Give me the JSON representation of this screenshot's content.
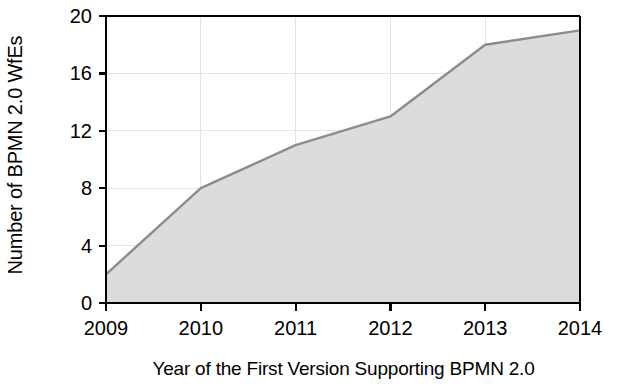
{
  "chart_data": {
    "type": "area",
    "title": "",
    "xlabel": "Year of the First Version Supporting BPMN 2.0",
    "ylabel": "Number of BPMN 2.0 WfEs",
    "categories": [
      "2009",
      "2010",
      "2011",
      "2012",
      "2013",
      "2014"
    ],
    "x": [
      2009,
      2010,
      2011,
      2012,
      2013,
      2014
    ],
    "values": [
      2,
      8,
      11,
      13,
      18,
      19
    ],
    "series": [
      {
        "name": "Number of BPMN 2.0 WfEs",
        "values": [
          2,
          8,
          11,
          13,
          18,
          19
        ]
      }
    ],
    "xlim": [
      2009,
      2014
    ],
    "ylim": [
      0,
      20
    ],
    "x_tick_labels": [
      "2009",
      "2010",
      "2011",
      "2012",
      "2013",
      "2014"
    ],
    "y_tick_labels": [
      "0",
      "4",
      "8",
      "12",
      "16",
      "20"
    ],
    "y_ticks": [
      0,
      4,
      8,
      12,
      16,
      20
    ],
    "grid": true,
    "legend": false,
    "legend_position": "none",
    "colors": {
      "area_fill": "#dcdcdc",
      "line": "#8c8c8c",
      "axis": "#000000",
      "grid": "#e4e4e4",
      "text": "#000000",
      "background": "#ffffff"
    }
  },
  "axes": {
    "y_title": "Number of BPMN 2.0 WfEs",
    "x_title": "Year of the First Version Supporting BPMN 2.0",
    "y_tick_labels": [
      {
        "value": 20,
        "label": "20"
      },
      {
        "value": 16,
        "label": "16"
      },
      {
        "value": 12,
        "label": "12"
      },
      {
        "value": 8,
        "label": "8"
      },
      {
        "value": 4,
        "label": "4"
      },
      {
        "value": 0,
        "label": "0"
      }
    ],
    "x_tick_labels": [
      {
        "value": 2009,
        "label": "2009"
      },
      {
        "value": 2010,
        "label": "2010"
      },
      {
        "value": 2011,
        "label": "2011"
      },
      {
        "value": 2012,
        "label": "2012"
      },
      {
        "value": 2013,
        "label": "2013"
      },
      {
        "value": 2014,
        "label": "2014"
      }
    ]
  }
}
